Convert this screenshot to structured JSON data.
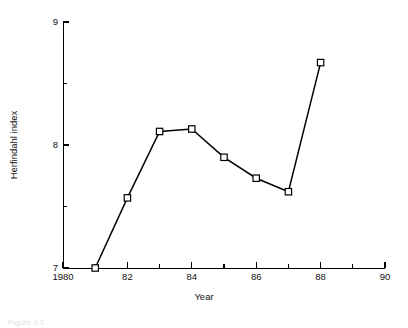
{
  "chart_data": {
    "type": "line",
    "title": "",
    "xlabel": "Year",
    "ylabel": "Herfindahl index",
    "xlim": [
      1980,
      1990
    ],
    "ylim": [
      7,
      9
    ],
    "grid": false,
    "legend": null,
    "x": [
      1981,
      1982,
      1983,
      1984,
      1985,
      1986,
      1987,
      1988
    ],
    "values": [
      7.0,
      7.57,
      8.11,
      8.13,
      7.9,
      7.73,
      7.62,
      8.67
    ],
    "series": [
      {
        "name": "Herfindahl index",
        "marker": "open-square",
        "color": "#000000",
        "values": [
          7.0,
          7.57,
          8.11,
          8.13,
          7.9,
          7.73,
          7.62,
          8.67
        ]
      }
    ],
    "x_ticks_major": [
      1980,
      1982,
      1984,
      1986,
      1988,
      1990
    ],
    "x_tick_labels": [
      "1980",
      "82",
      "84",
      "86",
      "88",
      "90"
    ],
    "x_ticks_minor": [
      1981,
      1983,
      1985,
      1987,
      1989
    ],
    "y_ticks_major": [
      7,
      8,
      9
    ],
    "y_tick_labels": [
      "7",
      "8",
      "9"
    ],
    "y_ticks_minor": [
      7.5,
      8.5
    ]
  },
  "caption": {
    "text": "Figure 4.3"
  }
}
